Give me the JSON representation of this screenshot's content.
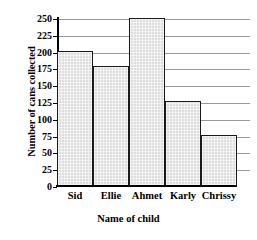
{
  "chart_data": {
    "type": "bar",
    "title": "",
    "categories": [
      "Sid",
      "Ellie",
      "Ahmet",
      "Karly",
      "Chrissy"
    ],
    "values": [
      200,
      177,
      248,
      125,
      75
    ],
    "xlabel": "Name of child",
    "ylabel": "Number of cans collected",
    "ylim": [
      0,
      250
    ],
    "ytick_labels": [
      "250",
      "225",
      "200",
      "175",
      "150",
      "125",
      "100",
      "75",
      "50",
      "25",
      "0"
    ],
    "ytick_values": [
      250,
      225,
      200,
      175,
      150,
      125,
      100,
      75,
      50,
      25,
      0
    ],
    "ytick_step": 25,
    "grid": true,
    "legend": false,
    "bar_fill_color": "#dedede",
    "bar_edge_color": "#1a1a1a",
    "gridline_color": "#9a9a9a",
    "axis_color": "#000000",
    "background_color": "#ffffff"
  }
}
